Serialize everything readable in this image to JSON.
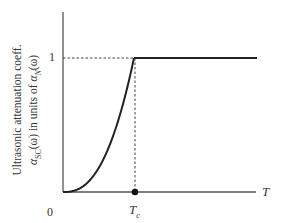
{
  "chart_data": {
    "type": "line",
    "title": "",
    "xlabel": "T",
    "ylabel_line1": "Ultrasonic attenuation coeff.",
    "ylabel_line2_sym": "α",
    "ylabel_line2_sub": "SC",
    "ylabel_line2_mid": "(ω) in units of ",
    "ylabel_line2_sym2": "α",
    "ylabel_line2_sub2": "N",
    "ylabel_line2_end": "(ω)",
    "y_tick_one": "1",
    "origin_label": "0",
    "x_marker_label": "T",
    "x_marker_sub": "c",
    "ylim": [
      0,
      1.4
    ],
    "xlim": [
      0,
      1.75
    ],
    "grid": false,
    "series": [
      {
        "name": "alpha_SC / alpha_N",
        "x": [
          0,
          0.2,
          0.4,
          0.6,
          0.8,
          0.9,
          1.0,
          1.75
        ],
        "values": [
          0,
          0.02,
          0.1,
          0.28,
          0.57,
          0.77,
          1.0,
          1.0
        ]
      }
    ],
    "annotations": [
      {
        "type": "dashed-hline",
        "y": 1,
        "from_x": 0,
        "to_x": 1
      },
      {
        "type": "dashed-vline",
        "x": 1,
        "from_y": 0,
        "to_y": 1
      },
      {
        "type": "point",
        "x": 1,
        "y": 0,
        "label": "Tc"
      }
    ]
  }
}
